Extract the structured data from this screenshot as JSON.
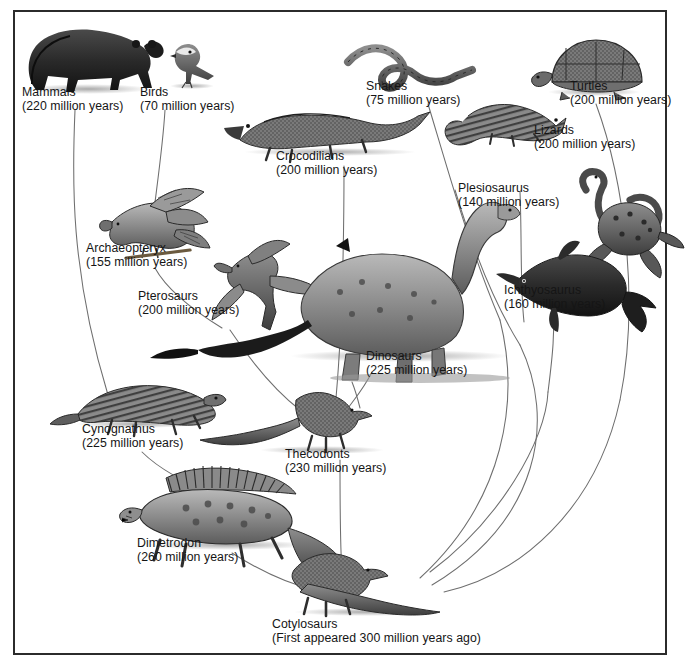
{
  "diagram": {
    "type": "phylogenetic-tree-illustration",
    "frame_color": "#2b2b2b",
    "background_color": "#ffffff",
    "line_color": "#6e6e6e",
    "root": "Cotylosaurs"
  },
  "taxa": [
    {
      "id": "mammals",
      "name": "Mammals",
      "age": "(220 million years)"
    },
    {
      "id": "birds",
      "name": "Birds",
      "age": "(70 million years)"
    },
    {
      "id": "crocodilians",
      "name": "Crocodilians",
      "age": "(200 million years)"
    },
    {
      "id": "snakes",
      "name": "Snakes",
      "age": "(75 million years)"
    },
    {
      "id": "turtles",
      "name": "Turtles",
      "age": "(200 million years)"
    },
    {
      "id": "lizards",
      "name": "Lizards",
      "age": "(200 million years)"
    },
    {
      "id": "plesiosaurus",
      "name": "Plesiosaurus",
      "age": "(140 million years)"
    },
    {
      "id": "archaeopteryx",
      "name": "Archaeopteryx",
      "age": "(155 million years)"
    },
    {
      "id": "pterosaurs",
      "name": "Pterosaurs",
      "age": "(200 million years)"
    },
    {
      "id": "ichthyosaurus",
      "name": "Ichthyosaurus",
      "age": "(160 million years)"
    },
    {
      "id": "dinosaurs",
      "name": "Dinosaurs",
      "age": "(225 million years)"
    },
    {
      "id": "cynognathus",
      "name": "Cynognathus",
      "age": "(225 million years)"
    },
    {
      "id": "thecodonts",
      "name": "Thecodonts",
      "age": "(230 million years)"
    },
    {
      "id": "dimetrodon",
      "name": "Dimetrodon",
      "age": "(260 million years)"
    },
    {
      "id": "cotylosaurs",
      "name": "Cotylosaurs",
      "age": "(First appeared 300 million years ago)"
    }
  ]
}
